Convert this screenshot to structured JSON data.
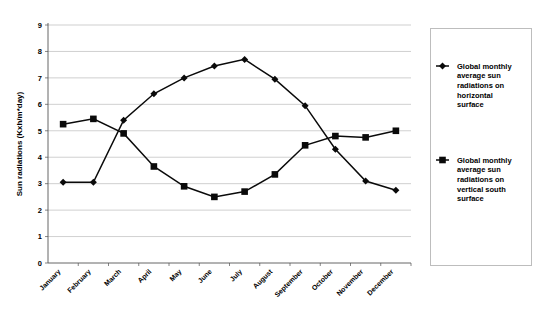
{
  "chart_data": {
    "type": "line",
    "title": "",
    "xlabel": "",
    "ylabel": "Sun radiations (Kxh/m*day)",
    "ylim": [
      0,
      9
    ],
    "yticks": [
      0,
      1,
      2,
      3,
      4,
      5,
      6,
      7,
      8,
      9
    ],
    "grid": true,
    "legend_position": "right",
    "categories": [
      "January",
      "February",
      "March",
      "April",
      "May",
      "June",
      "July",
      "August",
      "September",
      "October",
      "November",
      "December"
    ],
    "series": [
      {
        "name": "Global monthly average sun radiations on horizontal surface",
        "marker": "diamond",
        "color": "#0a0a0a",
        "values": [
          3.05,
          3.05,
          5.4,
          6.4,
          7.0,
          7.45,
          7.7,
          6.95,
          5.95,
          4.3,
          3.1,
          2.75
        ]
      },
      {
        "name": "Global monthly average sun radiations on vertical south surface",
        "marker": "square",
        "color": "#0a0a0a",
        "values": [
          5.25,
          5.45,
          4.9,
          3.65,
          2.9,
          2.5,
          2.7,
          3.35,
          4.45,
          4.8,
          4.75,
          5.0
        ]
      }
    ]
  },
  "legend": {
    "entries": [
      {
        "label": "Global monthly average sun radiations on horizontal surface",
        "marker": "diamond"
      },
      {
        "label": "Global monthly average sun radiations on vertical south surface",
        "marker": "square"
      }
    ]
  }
}
